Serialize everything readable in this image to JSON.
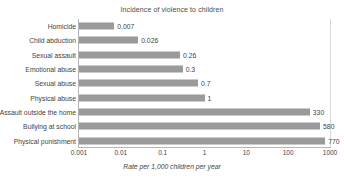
{
  "chart_data": {
    "type": "bar",
    "orientation": "horizontal",
    "title": "Incidence of violence to children",
    "xlabel": "Rate per 1,000 children per year",
    "ylabel": "",
    "xscale": "log",
    "xlim": [
      0.001,
      1000
    ],
    "grid": false,
    "legend": null,
    "bar_color": "#9a9a9a",
    "axis_color": "#b5b5b5",
    "xticks": [
      "0.001",
      "0.01",
      "0.1",
      "1",
      "10",
      "100",
      "1000"
    ],
    "xtick_values": [
      0.001,
      0.01,
      0.1,
      1,
      10,
      100,
      1000
    ],
    "categories": [
      "Homicide",
      "Child abduction",
      "Sexual assault",
      "Emotional abuse",
      "Sexual abuse",
      "Physical abuse",
      "Assault outside the home",
      "Bullying at school",
      "Physical punishment"
    ],
    "values": [
      0.007,
      0.026,
      0.26,
      0.3,
      0.7,
      1,
      330,
      580,
      770
    ],
    "value_labels": [
      "0.007",
      "0.026",
      "0.26",
      "0.3",
      "0.7",
      "1",
      "330",
      "580",
      "770"
    ]
  }
}
